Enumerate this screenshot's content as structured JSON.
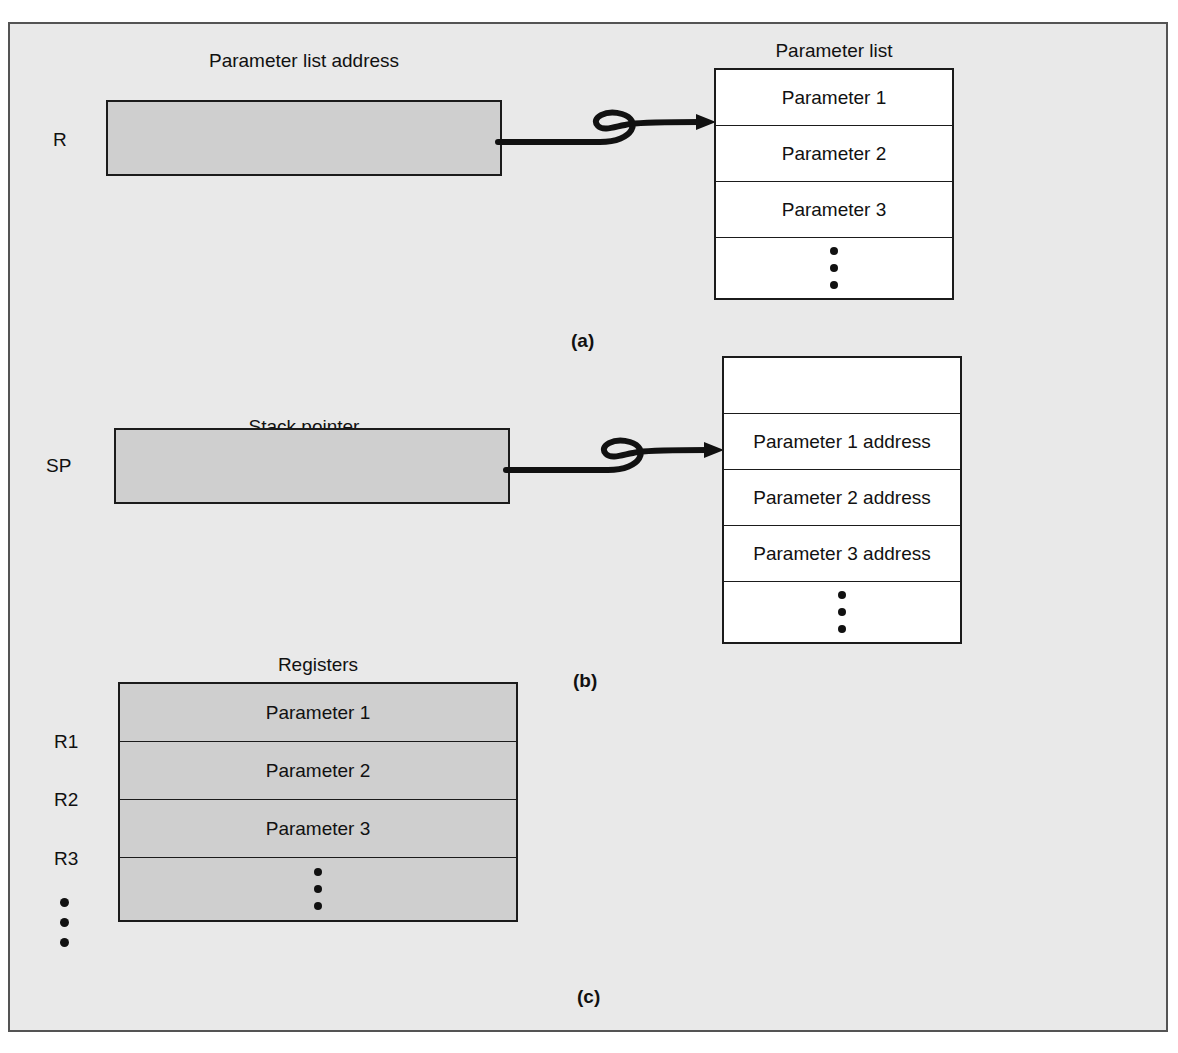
{
  "figure": {
    "background_color": "#e9e9e9",
    "register_fill_color": "#cfcfcf",
    "line_color": "#1b1b1b"
  },
  "parts": {
    "a": "(a)",
    "b": "(b)",
    "c": "(c)"
  },
  "part_a": {
    "register_label": "R",
    "register_caption": "Parameter list address",
    "table_caption": "Parameter list",
    "rows": [
      "Parameter 1",
      "Parameter 2",
      "Parameter 3",
      ""
    ],
    "ellipsis_row_index": 3,
    "arrow": "curved-arrow-right"
  },
  "part_b": {
    "register_label": "SP",
    "register_caption": "Stack pointer",
    "table_caption": "",
    "rows": [
      "",
      "Parameter 1 address",
      "Parameter 2 address",
      "Parameter 3 address",
      ""
    ],
    "ellipsis_row_index": 4,
    "arrow": "curved-arrow-right"
  },
  "part_c": {
    "table_caption": "Registers",
    "register_labels": [
      "R1",
      "R2",
      "R3"
    ],
    "rows": [
      "Parameter 1",
      "Parameter 2",
      "Parameter 3",
      ""
    ],
    "ellipsis_row_index": 3
  }
}
